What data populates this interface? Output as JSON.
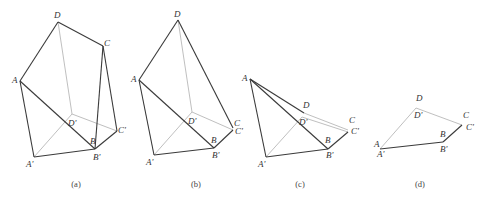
{
  "figures": [
    {
      "id": "a",
      "caption": "(a)",
      "caption_pos": [
        76,
        187
      ],
      "points": {
        "D": [
          58,
          22
        ],
        "C": [
          103,
          46
        ],
        "A": [
          20,
          81
        ],
        "D'": [
          72,
          114
        ],
        "C'": [
          117,
          131
        ],
        "B": [
          95,
          147
        ],
        "B'": [
          95,
          149
        ],
        "A'": [
          34,
          157
        ]
      },
      "dark_edges": [
        [
          "A",
          "D"
        ],
        [
          "D",
          "C"
        ],
        [
          "C",
          "B'"
        ],
        [
          "C",
          "C'"
        ],
        [
          "A",
          "B'"
        ],
        [
          "A",
          "A'"
        ],
        [
          "A'",
          "B'"
        ],
        [
          "B'",
          "C'"
        ]
      ],
      "light_edges": [
        [
          "D",
          "D'"
        ],
        [
          "D'",
          "C'"
        ],
        [
          "A'",
          "D'"
        ]
      ],
      "labels": [
        {
          "text": "D",
          "x": 54,
          "y": 18
        },
        {
          "text": "C",
          "x": 104,
          "y": 46
        },
        {
          "text": "A",
          "x": 12,
          "y": 83
        },
        {
          "text": "D'",
          "x": 68,
          "y": 126
        },
        {
          "text": "C'",
          "x": 118,
          "y": 133
        },
        {
          "text": "B",
          "x": 90,
          "y": 144
        },
        {
          "text": "B'",
          "x": 93,
          "y": 160
        },
        {
          "text": "A'",
          "x": 26,
          "y": 167
        }
      ]
    },
    {
      "id": "b",
      "caption": "(b)",
      "caption_pos": [
        196,
        187
      ],
      "points": {
        "D": [
          178,
          20
        ],
        "A": [
          139,
          80
        ],
        "D'": [
          192,
          112
        ],
        "C": [
          233,
          128
        ],
        "C'": [
          233,
          130
        ],
        "B": [
          214,
          146
        ],
        "B'": [
          214,
          148
        ],
        "A'": [
          154,
          155
        ]
      },
      "dark_edges": [
        [
          "A",
          "D"
        ],
        [
          "D",
          "C"
        ],
        [
          "A",
          "B'"
        ],
        [
          "A",
          "A'"
        ],
        [
          "A'",
          "B'"
        ],
        [
          "B'",
          "C'"
        ]
      ],
      "light_edges": [
        [
          "D",
          "D'"
        ],
        [
          "D'",
          "C'"
        ],
        [
          "A'",
          "D'"
        ]
      ],
      "labels": [
        {
          "text": "D",
          "x": 174,
          "y": 17
        },
        {
          "text": "A",
          "x": 131,
          "y": 82
        },
        {
          "text": "D'",
          "x": 188,
          "y": 124
        },
        {
          "text": "C",
          "x": 234,
          "y": 126
        },
        {
          "text": "C'",
          "x": 235,
          "y": 134
        },
        {
          "text": "B",
          "x": 211,
          "y": 143
        },
        {
          "text": "B'",
          "x": 212,
          "y": 158
        },
        {
          "text": "A'",
          "x": 146,
          "y": 165
        }
      ]
    },
    {
      "id": "c",
      "caption": "(c)",
      "caption_pos": [
        300,
        187
      ],
      "points": {
        "A": [
          250,
          79
        ],
        "D": [
          304,
          113
        ],
        "D'": [
          302,
          117
        ],
        "C": [
          348,
          130
        ],
        "C'": [
          348,
          132
        ],
        "B": [
          328,
          147
        ],
        "B'": [
          328,
          149
        ],
        "A'": [
          266,
          157
        ]
      },
      "dark_edges": [
        [
          "A",
          "D"
        ],
        [
          "A",
          "B'"
        ],
        [
          "A",
          "A'"
        ],
        [
          "A'",
          "B'"
        ],
        [
          "B'",
          "C'"
        ]
      ],
      "light_edges": [
        [
          "D",
          "C"
        ],
        [
          "D'",
          "C'"
        ],
        [
          "A'",
          "D'"
        ]
      ],
      "labels": [
        {
          "text": "A",
          "x": 242,
          "y": 81
        },
        {
          "text": "D",
          "x": 303,
          "y": 108
        },
        {
          "text": "D'",
          "x": 299,
          "y": 125
        },
        {
          "text": "C",
          "x": 349,
          "y": 123
        },
        {
          "text": "C'",
          "x": 351,
          "y": 134
        },
        {
          "text": "B",
          "x": 325,
          "y": 143
        },
        {
          "text": "B'",
          "x": 326,
          "y": 158
        },
        {
          "text": "A'",
          "x": 258,
          "y": 167
        }
      ]
    },
    {
      "id": "d",
      "caption": "(d)",
      "caption_pos": [
        420,
        187
      ],
      "points": {
        "D": [
          416,
          106
        ],
        "D'": [
          416,
          108
        ],
        "C": [
          462,
          123
        ],
        "C'": [
          462,
          125
        ],
        "B": [
          443,
          140
        ],
        "B'": [
          443,
          142
        ],
        "A": [
          380,
          147
        ],
        "A'": [
          380,
          149
        ]
      },
      "dark_edges": [
        [
          "A'",
          "B'"
        ],
        [
          "B'",
          "C'"
        ]
      ],
      "light_edges": [
        [
          "D'",
          "C'"
        ],
        [
          "A'",
          "D'"
        ]
      ],
      "labels": [
        {
          "text": "D",
          "x": 416,
          "y": 101
        },
        {
          "text": "D'",
          "x": 414,
          "y": 118
        },
        {
          "text": "C",
          "x": 463,
          "y": 118
        },
        {
          "text": "C'",
          "x": 466,
          "y": 130
        },
        {
          "text": "B",
          "x": 440,
          "y": 137
        },
        {
          "text": "B'",
          "x": 440,
          "y": 152
        },
        {
          "text": "A",
          "x": 374,
          "y": 147
        },
        {
          "text": "A'",
          "x": 377,
          "y": 157
        }
      ]
    }
  ]
}
